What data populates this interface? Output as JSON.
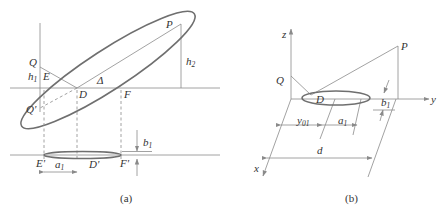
{
  "figure_a": {
    "caption": "(a)",
    "labels": {
      "P": "P",
      "Q": "Q",
      "Q_prime": "Q'",
      "E": "E",
      "D": "D",
      "F": "F",
      "Delta": "Δ",
      "h1": "h",
      "h1_sub": "1",
      "h2": "h",
      "h2_sub": "2",
      "E_prime": "E'",
      "D_prime": "D'",
      "F_prime": "F'",
      "a1": "a",
      "a1_sub": "1",
      "b1": "b",
      "b1_sub": "1"
    }
  },
  "figure_b": {
    "caption": "(b)",
    "labels": {
      "z": "z",
      "y": "y",
      "x": "x",
      "P": "P",
      "Q": "Q",
      "D": "D",
      "y01": "y",
      "y01_sub": "01",
      "a1": "a",
      "a1_sub": "1",
      "b1": "b",
      "b1_sub": "1",
      "d": "d"
    }
  },
  "colors": {
    "line": "#8a8a8a",
    "ellipse": "#6f6f6f",
    "text": "#333333",
    "background": "#ffffff"
  }
}
